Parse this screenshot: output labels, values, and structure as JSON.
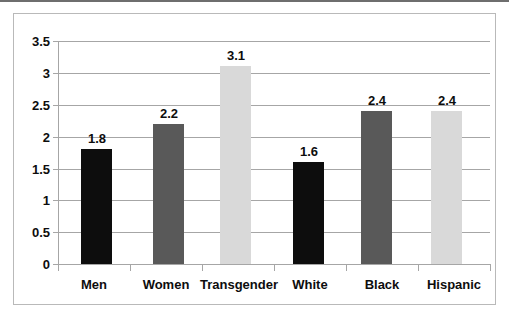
{
  "chart_data": {
    "type": "bar",
    "title": "",
    "subtitle": "",
    "xlabel": "",
    "ylabel": "",
    "categories": [
      "Men",
      "Women",
      "Transgender",
      "White",
      "Black",
      "Hispanic"
    ],
    "values": [
      1.8,
      2.2,
      3.1,
      1.6,
      2.4,
      2.4
    ],
    "value_labels": [
      "1.8",
      "2.2",
      "3.1",
      "1.6",
      "2.4",
      "2.4"
    ],
    "bar_colors": [
      "#0d0d0d",
      "#595959",
      "#d9d9d9",
      "#0d0d0d",
      "#595959",
      "#d9d9d9"
    ],
    "ylim": [
      0,
      3.5
    ],
    "ytick_labels": [
      "3.5",
      "3",
      "2.5",
      "2",
      "1.5",
      "1",
      "0.5",
      "0"
    ],
    "ytick_values": [
      3.5,
      3,
      2.5,
      2,
      1.5,
      1,
      0.5,
      0
    ],
    "grid": true,
    "grid_color": "#a6a6a6",
    "axis_color": "#a6a6a6",
    "legend": null,
    "legend_position": "none",
    "data_labels_shown": true,
    "plot_background": "#ffffff"
  },
  "frame": {
    "border_color": "#b9b9b9",
    "background": "#ffffff"
  }
}
